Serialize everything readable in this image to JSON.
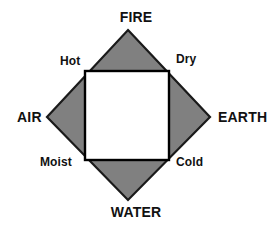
{
  "figure": {
    "background_color": "#ffffff",
    "diamond_fill_color": "#808080",
    "diamond_stroke_color": "#1a1a1a",
    "inner_square_fill_color": "#ffffff",
    "inner_square_stroke_color": "#000000",
    "text_color": "#111111"
  },
  "elements": {
    "top": {
      "label": "FIRE",
      "position": "top-vertex"
    },
    "left": {
      "label": "AIR",
      "position": "left-vertex"
    },
    "right": {
      "label": "EARTH",
      "position": "right-vertex"
    },
    "bottom": {
      "label": "WATER",
      "position": "bottom-vertex"
    }
  },
  "qualities": {
    "top_left": {
      "label": "Hot",
      "position": "upper-left-edge"
    },
    "top_right": {
      "label": "Dry",
      "position": "upper-right-edge"
    },
    "bottom_left": {
      "label": "Moist",
      "position": "lower-left-edge"
    },
    "bottom_right": {
      "label": "Cold",
      "position": "lower-right-edge"
    }
  },
  "chart_data": {
    "type": "diagram",
    "shapes": [
      {
        "name": "outer-diamond",
        "kind": "polygon",
        "fill": "#808080",
        "stroke": "#1a1a1a",
        "stroke_width": 2,
        "points": [
          [
            128,
            30
          ],
          [
            210,
            117
          ],
          [
            128,
            200
          ],
          [
            47,
            117
          ]
        ]
      },
      {
        "name": "inner-square",
        "kind": "rect",
        "fill": "#ffffff",
        "stroke": "#000000",
        "stroke_width": 2,
        "x": 85,
        "y": 71,
        "width": 84,
        "height": 89
      }
    ],
    "vertex_labels": [
      "FIRE",
      "EARTH",
      "WATER",
      "AIR"
    ],
    "edge_labels": [
      "Hot",
      "Dry",
      "Cold",
      "Moist"
    ],
    "pairings": [
      {
        "element": "FIRE",
        "qualities": [
          "Hot",
          "Dry"
        ]
      },
      {
        "element": "EARTH",
        "qualities": [
          "Dry",
          "Cold"
        ]
      },
      {
        "element": "WATER",
        "qualities": [
          "Cold",
          "Moist"
        ]
      },
      {
        "element": "AIR",
        "qualities": [
          "Moist",
          "Hot"
        ]
      }
    ]
  }
}
